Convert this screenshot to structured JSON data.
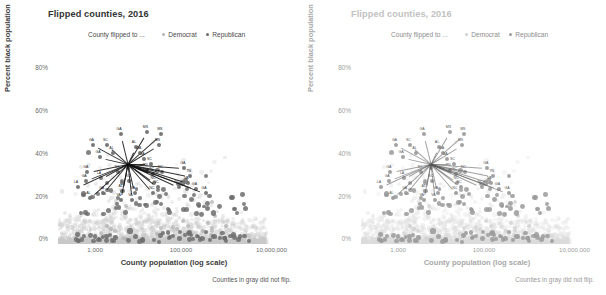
{
  "panels": [
    {
      "title": "Flipped counties, 2016",
      "faded": false,
      "legend": {
        "title": "County flipped to ...",
        "items": [
          {
            "label": "Democrat",
            "color": "#b4b4b4"
          },
          {
            "label": "Republican",
            "color": "#6d6d6d"
          }
        ]
      },
      "ylabel": "Percent black population",
      "xlabel": "County population (log scale)",
      "yticks": [
        "80%",
        "60%",
        "40%",
        "20%",
        "0%"
      ],
      "xticks": [
        "1,000",
        "100,000",
        "10,000,000"
      ],
      "footnote": "Counties in gray did not flip."
    },
    {
      "title": "Flipped counties, 2016",
      "faded": true,
      "legend": {
        "title": "County flipped to ...",
        "items": [
          {
            "label": "Democrat",
            "color": "#cfcfcf"
          },
          {
            "label": "Republican",
            "color": "#9a9a9a"
          }
        ]
      },
      "ylabel": "Percent black population",
      "xlabel": "County population (log scale)",
      "yticks": [
        "80%",
        "60%",
        "40%",
        "20%",
        "0%"
      ],
      "xticks": [
        "1,000",
        "100,000",
        "10,000,000"
      ],
      "footnote": "Counties in gray did not flip."
    }
  ],
  "chart_data": {
    "type": "scatter",
    "title": "Flipped counties, 2016",
    "xlabel": "County population (log scale)",
    "ylabel": "Percent black population",
    "xscale": "log",
    "xlim": [
      1000,
      10000000
    ],
    "ylim": [
      0,
      88
    ],
    "xticks": [
      1000,
      100000,
      10000000
    ],
    "yticks": [
      0,
      20,
      40,
      60,
      80
    ],
    "grid": false,
    "legend_position": "top",
    "note": "Counties in gray did not flip.",
    "series": [
      {
        "name": "Did not flip",
        "color": "#c8c8c8",
        "marker_opacity": 0.3,
        "count": 2700,
        "description": "Dense gray cloud: heavy band along 0-6% black population across all populations, thinning plume rising to ~85% near populations of 10,000-200,000."
      },
      {
        "name": "Democrat",
        "color": "#b4b4b4",
        "count": 22,
        "description": "Light gray flipped-to-Democrat counties, mostly mid-size populations."
      },
      {
        "name": "Republican",
        "color": "#6d6d6d",
        "count": 120,
        "description": "Darker flipped-to-Republican counties, concentrated in the South with high black population share."
      }
    ],
    "annotations": [
      {
        "label": "GA",
        "x": 12000,
        "y": 52
      },
      {
        "label": "GA",
        "x": 4000,
        "y": 47
      },
      {
        "label": "SC",
        "x": 7000,
        "y": 47
      },
      {
        "label": "AL",
        "x": 9000,
        "y": 43
      },
      {
        "label": "GA",
        "x": 5200,
        "y": 41
      },
      {
        "label": "MS",
        "x": 34000,
        "y": 53
      },
      {
        "label": "MS",
        "x": 60000,
        "y": 52
      },
      {
        "label": "MS",
        "x": 55000,
        "y": 47
      },
      {
        "label": "AL",
        "x": 22000,
        "y": 46
      },
      {
        "label": "GA",
        "x": 26000,
        "y": 43
      },
      {
        "label": "GA",
        "x": 30000,
        "y": 40
      },
      {
        "label": "SC",
        "x": 40000,
        "y": 38
      },
      {
        "label": "TN",
        "x": 34000,
        "y": 35
      },
      {
        "label": "SC",
        "x": 44000,
        "y": 33
      },
      {
        "label": "NC",
        "x": 62000,
        "y": 34
      },
      {
        "label": "GA",
        "x": 3200,
        "y": 34
      },
      {
        "label": "SC",
        "x": 11000,
        "y": 34
      },
      {
        "label": "GA",
        "x": 3000,
        "y": 30
      },
      {
        "label": "LA",
        "x": 5500,
        "y": 31
      },
      {
        "label": "LA",
        "x": 2200,
        "y": 27
      },
      {
        "label": "SC",
        "x": 17000,
        "y": 30
      },
      {
        "label": "NC",
        "x": 46000,
        "y": 29
      },
      {
        "label": "NC",
        "x": 52000,
        "y": 27
      },
      {
        "label": "GA",
        "x": 6000,
        "y": 24
      },
      {
        "label": "AL",
        "x": 13000,
        "y": 25
      },
      {
        "label": "VA",
        "x": 21000,
        "y": 24
      },
      {
        "label": "NC",
        "x": 44000,
        "y": 24
      },
      {
        "label": "AL",
        "x": 3600,
        "y": 22
      },
      {
        "label": "VA",
        "x": 12000,
        "y": 21
      },
      {
        "label": "VA",
        "x": 19000,
        "y": 21
      },
      {
        "label": "GA",
        "x": 150000,
        "y": 36
      },
      {
        "label": "TN",
        "x": 190000,
        "y": 32
      },
      {
        "label": "VA",
        "x": 175000,
        "y": 29
      },
      {
        "label": "GA",
        "x": 240000,
        "y": 26
      },
      {
        "label": "GA",
        "x": 350000,
        "y": 24
      },
      {
        "label": "NC",
        "x": 120000,
        "y": 27
      }
    ]
  }
}
